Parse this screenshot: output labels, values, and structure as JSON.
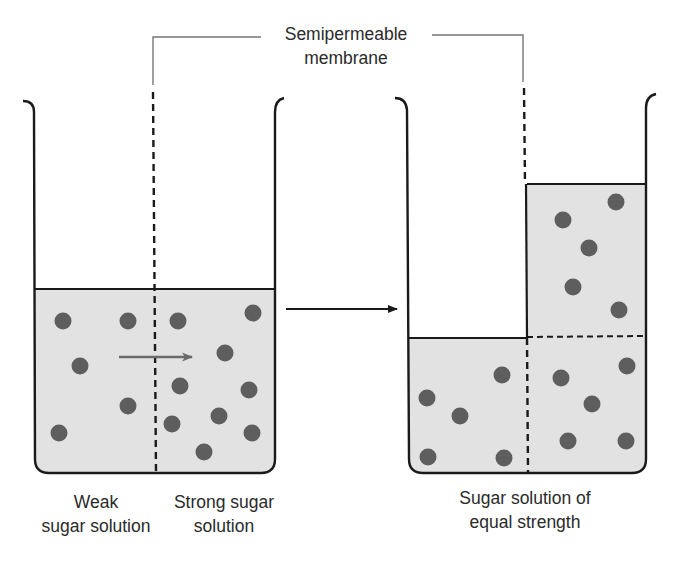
{
  "colors": {
    "solution_fill": "#e2e2e2",
    "particle": "#5e5e5e",
    "outline": "#1a1a1a",
    "arrow_flow": "#6a6a6a",
    "leader_line": "#777777"
  },
  "membrane_label": {
    "line1": "Semipermeable",
    "line2": "membrane"
  },
  "left_beaker": {
    "left_label": {
      "line1": "Weak",
      "line2": "sugar solution"
    },
    "right_label": {
      "line1": "Strong sugar",
      "line2": "solution"
    },
    "left_particles": [
      [
        63,
        321
      ],
      [
        128,
        321
      ],
      [
        80,
        366
      ],
      [
        128,
        406
      ],
      [
        59,
        433
      ]
    ],
    "right_particles": [
      [
        178,
        321
      ],
      [
        253,
        313
      ],
      [
        225,
        353
      ],
      [
        180,
        386
      ],
      [
        249,
        390
      ],
      [
        172,
        424
      ],
      [
        219,
        416
      ],
      [
        252,
        433
      ],
      [
        204,
        452
      ]
    ],
    "flow_arrow": "water moves from weak to strong solution"
  },
  "right_beaker": {
    "label": {
      "line1": "Sugar solution of",
      "line2": "equal strength"
    },
    "left_particles": [
      [
        502,
        375
      ],
      [
        427,
        398
      ],
      [
        460,
        416
      ],
      [
        428,
        457
      ],
      [
        504,
        458
      ]
    ],
    "right_particles": [
      [
        563,
        220
      ],
      [
        616,
        202
      ],
      [
        589,
        248
      ],
      [
        573,
        287
      ],
      [
        619,
        310
      ],
      [
        561,
        378
      ],
      [
        627,
        366
      ],
      [
        592,
        404
      ],
      [
        568,
        441
      ],
      [
        626,
        441
      ]
    ]
  },
  "process_arrow": "leads to"
}
